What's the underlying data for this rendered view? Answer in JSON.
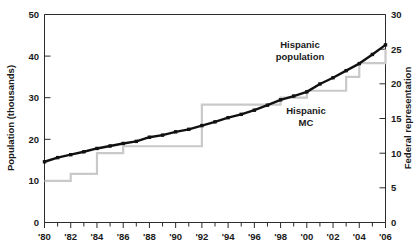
{
  "chart_data": {
    "type": "line",
    "title": "",
    "xlabel": "",
    "ylabel": "Population (thousands)",
    "y2label": "Federal representation",
    "xlim": [
      1980,
      2006
    ],
    "ylim": [
      0,
      50
    ],
    "y2lim": [
      0,
      30
    ],
    "grid": false,
    "legend_position": "inline-annotation",
    "x_tick_labels": [
      "'80",
      "'82",
      "'84",
      "'86",
      "'88",
      "'90",
      "'92",
      "'94",
      "'96",
      "'98",
      "'00",
      "'02",
      "'04",
      "'06"
    ],
    "x_tick_values": [
      1980,
      1982,
      1984,
      1986,
      1988,
      1990,
      1992,
      1994,
      1996,
      1998,
      2000,
      2002,
      2004,
      2006
    ],
    "x_minor_tick_values": [
      1981,
      1983,
      1985,
      1987,
      1989,
      1991,
      1993,
      1995,
      1997,
      1999,
      2001,
      2003,
      2005
    ],
    "y_tick_labels": [
      "0",
      "10",
      "20",
      "30",
      "40",
      "50"
    ],
    "y_tick_values": [
      0,
      10,
      20,
      30,
      40,
      50
    ],
    "y2_tick_labels": [
      "0",
      "5",
      "10",
      "15",
      "20",
      "25",
      "30"
    ],
    "y2_tick_values": [
      0,
      5,
      10,
      15,
      20,
      25,
      30
    ],
    "series": [
      {
        "name": "Hispanic population",
        "axis": "left",
        "style": "line-markers",
        "color": "#111111",
        "annotation": "Hispanic\npopulation",
        "annotation_line1": "Hispanic",
        "annotation_line2": "population",
        "x": [
          1980,
          1981,
          1982,
          1983,
          1984,
          1985,
          1986,
          1987,
          1988,
          1989,
          1990,
          1991,
          1992,
          1993,
          1994,
          1995,
          1996,
          1997,
          1998,
          1999,
          2000,
          2001,
          2002,
          2003,
          2004,
          2005,
          2006
        ],
        "values": [
          14.6,
          15.6,
          16.3,
          17.0,
          17.8,
          18.4,
          19.0,
          19.5,
          20.5,
          21.0,
          21.8,
          22.4,
          23.3,
          24.2,
          25.2,
          26.0,
          27.0,
          28.2,
          29.5,
          30.4,
          31.4,
          33.3,
          34.8,
          36.5,
          38.2,
          40.4,
          42.7
        ]
      },
      {
        "name": "Hispanic MC",
        "axis": "right",
        "style": "step",
        "color": "#c9c9c9",
        "annotation": "Hispanic\nMC",
        "annotation_line1": "Hispanic",
        "annotation_line2": "MC",
        "x": [
          1980,
          1981,
          1982,
          1983,
          1984,
          1985,
          1986,
          1987,
          1988,
          1989,
          1990,
          1991,
          1992,
          1993,
          1994,
          1995,
          1996,
          1997,
          1998,
          1999,
          2000,
          2001,
          2002,
          2003,
          2004,
          2005,
          2006
        ],
        "values": [
          6,
          6,
          7,
          7,
          10,
          10,
          11,
          11,
          11,
          11,
          11,
          11,
          17,
          17,
          17,
          17,
          17,
          17,
          18,
          18,
          19,
          19,
          19,
          21,
          23,
          23,
          25
        ]
      }
    ]
  },
  "labels": {
    "y_axis_title": "Population (thousands)",
    "y2_axis_title": "Federal representation",
    "series_1_line1": "Hispanic",
    "series_1_line2": "population",
    "series_2_line1": "Hispanic",
    "series_2_line2": "MC"
  },
  "ticks": {
    "x": [
      "'80",
      "'82",
      "'84",
      "'86",
      "'88",
      "'90",
      "'92",
      "'94",
      "'96",
      "'98",
      "'00",
      "'02",
      "'04",
      "'06"
    ],
    "y_left": [
      "50",
      "40",
      "30",
      "20",
      "10",
      "0"
    ],
    "y_right": [
      "30",
      "25",
      "20",
      "15",
      "10",
      "5",
      "0"
    ]
  },
  "colors": {
    "population_line": "#111111",
    "mc_step_line": "#c9c9c9",
    "axis": "#2b2b2b",
    "text": "#1a1a1a",
    "background": "#ffffff"
  }
}
